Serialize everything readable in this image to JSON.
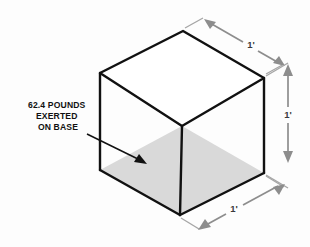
{
  "figure": {
    "shape": "cube",
    "shading_color": "#d9d9d9",
    "edge_color": "#111111",
    "dimension_color": "#8d8d8d"
  },
  "callout": {
    "name": "weight-callout",
    "lines": [
      "62.4 POUNDS",
      "EXERTED",
      "ON BASE"
    ],
    "line1": "62.4 POUNDS",
    "line2": "EXERTED",
    "line3": "ON BASE",
    "arrow_target": "shaded-base-face"
  },
  "dimensions": [
    {
      "id": "top-right-edge",
      "label": "1'",
      "orientation": "oblique-top"
    },
    {
      "id": "vertical-right-edge",
      "label": "1'",
      "orientation": "vertical"
    },
    {
      "id": "bottom-right-edge",
      "label": "1'",
      "orientation": "oblique-bottom"
    }
  ],
  "dimension_labels": {
    "top": "1'",
    "right": "1'",
    "bottom": "1'"
  }
}
